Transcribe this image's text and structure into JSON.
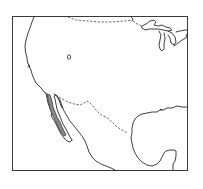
{
  "map": {
    "type": "species-range-map",
    "region": "Western North America",
    "colors": {
      "background": "#ffffff",
      "outline": "#2a2a2a",
      "range_fill": "#8a8a8a"
    },
    "features": [
      {
        "name": "Pacific coastline",
        "style": "solid"
      },
      {
        "name": "US-Canada border",
        "style": "dashed"
      },
      {
        "name": "US-Mexico border",
        "style": "dashed"
      },
      {
        "name": "Great Lakes",
        "style": "solid"
      },
      {
        "name": "Gulf of Mexico coastline",
        "style": "solid"
      },
      {
        "name": "Baja California peninsula",
        "style": "solid"
      },
      {
        "name": "Great Salt Lake",
        "style": "solid"
      }
    ],
    "range": {
      "label": "shaded distribution",
      "location": "Baja California / southern California"
    }
  }
}
